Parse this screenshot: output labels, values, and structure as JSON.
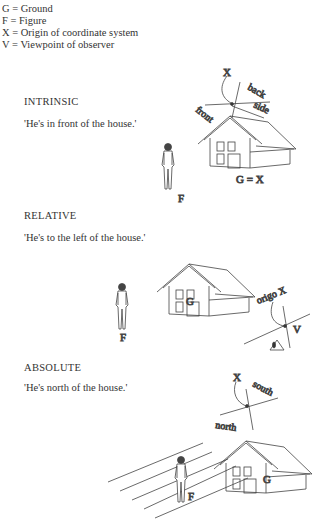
{
  "legend": [
    "G = Ground",
    "F = Figure",
    "X = Origin of coordinate system",
    "V = Viewpoint of observer"
  ],
  "sections": [
    {
      "heading": "INTRINSIC",
      "caption": "'He's in front of the house.'",
      "labels": {
        "x": "X",
        "back": "back",
        "side": "side",
        "front": "front",
        "ground": "G = X",
        "figure": "F"
      }
    },
    {
      "heading": "RELATIVE",
      "caption": "'He's to the left of the house.'",
      "labels": {
        "ground": "G",
        "figure": "F",
        "origo": "origo X",
        "viewpoint": "V"
      }
    },
    {
      "heading": "ABSOLUTE",
      "caption": "'He's north of the house.'",
      "labels": {
        "x": "X",
        "south": "south",
        "north": "north",
        "ground": "G",
        "figure": "F"
      }
    }
  ]
}
